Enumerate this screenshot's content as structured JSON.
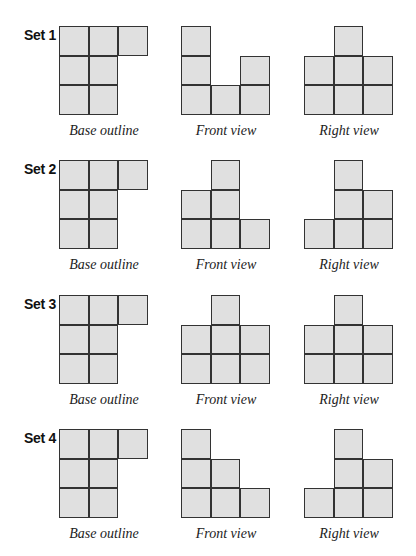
{
  "colors": {
    "cell_fill": "#e0e0e0",
    "cell_border": "#333333",
    "background": "#ffffff"
  },
  "captions": {
    "base": "Base outline",
    "front": "Front view",
    "right": "Right view"
  },
  "sets": [
    {
      "label": "Set 1",
      "base": [
        [
          1,
          1,
          1
        ],
        [
          1,
          1,
          0
        ],
        [
          1,
          1,
          0
        ]
      ],
      "front": [
        [
          1,
          0,
          0
        ],
        [
          1,
          0,
          1
        ],
        [
          1,
          1,
          1
        ]
      ],
      "right": [
        [
          0,
          1,
          0
        ],
        [
          1,
          1,
          1
        ],
        [
          1,
          1,
          1
        ]
      ]
    },
    {
      "label": "Set 2",
      "base": [
        [
          1,
          1,
          1
        ],
        [
          1,
          1,
          0
        ],
        [
          1,
          1,
          0
        ]
      ],
      "front": [
        [
          0,
          1,
          0
        ],
        [
          1,
          1,
          0
        ],
        [
          1,
          1,
          1
        ]
      ],
      "right": [
        [
          0,
          1,
          0
        ],
        [
          0,
          1,
          1
        ],
        [
          1,
          1,
          1
        ]
      ]
    },
    {
      "label": "Set 3",
      "base": [
        [
          1,
          1,
          1
        ],
        [
          1,
          1,
          0
        ],
        [
          1,
          1,
          0
        ]
      ],
      "front": [
        [
          0,
          1,
          0
        ],
        [
          1,
          1,
          1
        ],
        [
          1,
          1,
          1
        ]
      ],
      "right": [
        [
          0,
          1,
          0
        ],
        [
          1,
          1,
          1
        ],
        [
          1,
          1,
          1
        ]
      ]
    },
    {
      "label": "Set 4",
      "base": [
        [
          1,
          1,
          1
        ],
        [
          1,
          1,
          0
        ],
        [
          1,
          1,
          0
        ]
      ],
      "front": [
        [
          1,
          0,
          0
        ],
        [
          1,
          1,
          0
        ],
        [
          1,
          1,
          1
        ]
      ],
      "right": [
        [
          0,
          1,
          0
        ],
        [
          0,
          1,
          1
        ],
        [
          1,
          1,
          1
        ]
      ]
    }
  ]
}
